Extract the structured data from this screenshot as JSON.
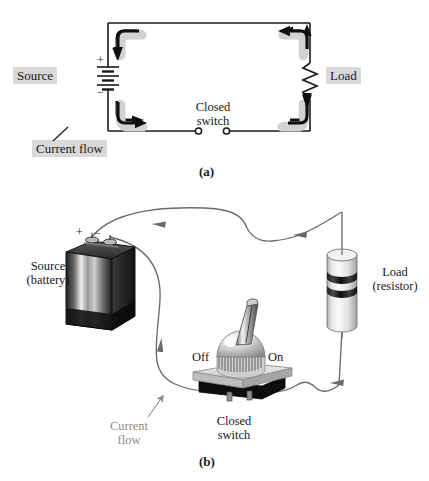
{
  "figure": {
    "title_alt": "Electric circuit: schematic and pictorial",
    "panel_a": {
      "caption": "(a)",
      "labels": {
        "source": "Source",
        "load": "Load",
        "closed_switch_line1": "Closed",
        "closed_switch_line2": "switch",
        "current_flow": "Current flow",
        "plus": "+",
        "minus": "−"
      },
      "components": {
        "source_symbol": "battery-schematic-symbol",
        "load_symbol": "resistor-zigzag-symbol",
        "switch_symbol": "closed-switch-contacts"
      },
      "arrow_count": 4,
      "arrow_direction": "clockwise"
    },
    "panel_b": {
      "caption": "(b)",
      "labels": {
        "source_line1": "Source",
        "source_line2": "(battery)",
        "load_line1": "Load",
        "load_line2": "(resistor)",
        "off": "Off",
        "on": "On",
        "closed_switch_line1": "Closed",
        "closed_switch_line2": "switch",
        "current_flow_line1": "Current",
        "current_flow_line2": "flow",
        "plus": "+",
        "minus": "−"
      },
      "components": {
        "battery": "lantern-battery-pictorial",
        "resistor": "cylindrical-resistor-pictorial",
        "switch": "toggle-switch-pictorial",
        "switch_position": "On"
      }
    },
    "colors": {
      "highlight_box": "#d9d9d9",
      "wire": "#6b6b6b",
      "arrow_dark": "#111111",
      "arrow_shadow": "#cfcfcf",
      "text": "#1a1a1a",
      "gray_text": "#8c8c8c",
      "battery_dark": "#2a2a2a",
      "resistor_body": "#e9e9e9",
      "resistor_band": "#2f2f2f",
      "switch_plate": "#d2d2d2",
      "switch_base": "#0d0d0d"
    }
  }
}
